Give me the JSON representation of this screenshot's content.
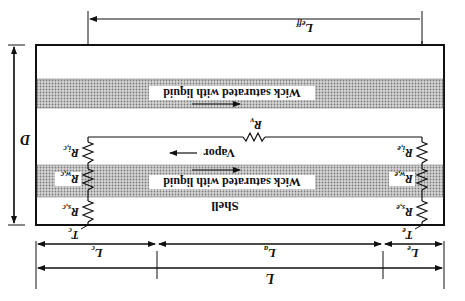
{
  "diagram": {
    "orientation": "rotated 180 degrees",
    "colors": {
      "line": "#111111",
      "wick_fill": "#b8b8b8",
      "background": "#ffffff"
    },
    "regions": {
      "shell": "Shell",
      "wick_top": "Wick saturated with liquid",
      "wick_bottom": "Wick saturated with liquid",
      "vapor": "Vapor"
    },
    "nodes": {
      "T_c": {
        "main": "T",
        "sub": "c"
      },
      "T_e": {
        "main": "T",
        "sub": "e"
      }
    },
    "resistors": {
      "R_sc": {
        "main": "R",
        "sub": "s,c"
      },
      "R_wc": {
        "main": "R",
        "sub": "w,c"
      },
      "R_ic": {
        "main": "R",
        "sub": "i,c"
      },
      "R_se": {
        "main": "R",
        "sub": "s,e"
      },
      "R_we": {
        "main": "R",
        "sub": "w,e"
      },
      "R_ie": {
        "main": "R",
        "sub": "i,e"
      },
      "R_v": {
        "main": "R",
        "sub": "v"
      }
    },
    "dimensions": {
      "L_eff": {
        "main": "L",
        "sub": "eff"
      },
      "L_c": {
        "main": "L",
        "sub": "c"
      },
      "L_a": {
        "main": "L",
        "sub": "a"
      },
      "L_e": {
        "main": "L",
        "sub": "e"
      },
      "L": {
        "main": "L"
      },
      "D": {
        "main": "D"
      }
    }
  }
}
